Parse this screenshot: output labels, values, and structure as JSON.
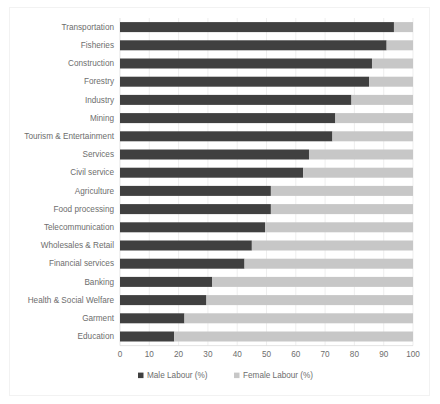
{
  "chart_data": {
    "type": "bar",
    "orientation": "horizontal",
    "stacked": true,
    "stack_mode": "percent",
    "title": "",
    "xlabel": "",
    "ylabel": "",
    "xlim": [
      0,
      100
    ],
    "xticks": [
      0,
      10,
      20,
      30,
      40,
      50,
      60,
      70,
      80,
      90,
      100
    ],
    "xtick_labels": [
      "0",
      "10",
      "20",
      "30",
      "40",
      "50",
      "60",
      "70",
      "80",
      "90",
      "100"
    ],
    "grid": "vertical",
    "legend_position": "bottom",
    "categories": [
      "Transportation",
      "Fisheries",
      "Construction",
      "Forestry",
      "Industry",
      "Mining",
      "Tourism & Entertainment",
      "Services",
      "Civil service",
      "Agriculture",
      "Food processing",
      "Telecommunication",
      "Wholesales & Retail",
      "Financial services",
      "Banking",
      "Health & Social Welfare",
      "Garment",
      "Education"
    ],
    "series": [
      {
        "name": "Male Labour (%)",
        "color": "#404040",
        "values": [
          93.5,
          91,
          86,
          85,
          79,
          73.5,
          72.5,
          64.5,
          62.5,
          51.5,
          51.5,
          49.5,
          45,
          42.5,
          31.5,
          29.5,
          22,
          18.5
        ]
      },
      {
        "name": "Female Labour (%)",
        "color": "#c7c7c7",
        "values": [
          6.5,
          9,
          14,
          15,
          21,
          26.5,
          27.5,
          35.5,
          37.5,
          48.5,
          48.5,
          50.5,
          55,
          57.5,
          68.5,
          70.5,
          78,
          81.5
        ]
      }
    ],
    "legend": [
      {
        "label": "Male Labour (%)",
        "marker": "square",
        "color": "#404040"
      },
      {
        "label": "Female Labour (%)",
        "marker": "square",
        "color": "#c7c7c7"
      }
    ]
  },
  "colors": {
    "male": "#404040",
    "female": "#c7c7c7",
    "grid": "#e6e6e6",
    "text": "#6d6d6d",
    "background": "#ffffff"
  }
}
